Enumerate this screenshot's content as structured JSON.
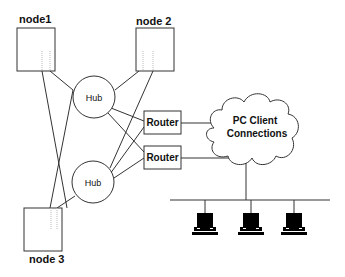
{
  "diagram": {
    "nodes": [
      {
        "id": "node1",
        "label": "node1"
      },
      {
        "id": "node2",
        "label": "node 2"
      },
      {
        "id": "node3",
        "label": "node 3"
      }
    ],
    "hubs": [
      {
        "id": "hub1",
        "label": "Hub"
      },
      {
        "id": "hub2",
        "label": "Hub"
      }
    ],
    "routers": [
      {
        "id": "router1",
        "label": "Router"
      },
      {
        "id": "router2",
        "label": "Router"
      }
    ],
    "cloud": {
      "line1": "PC Client",
      "line2": "Connections"
    },
    "clients": [
      {
        "id": "pc1",
        "icon": "computer-icon"
      },
      {
        "id": "pc2",
        "icon": "computer-icon"
      },
      {
        "id": "pc3",
        "icon": "computer-icon"
      }
    ],
    "colors": {
      "stroke": "#333333",
      "fill": "#ffffff",
      "text": "#111111"
    }
  }
}
